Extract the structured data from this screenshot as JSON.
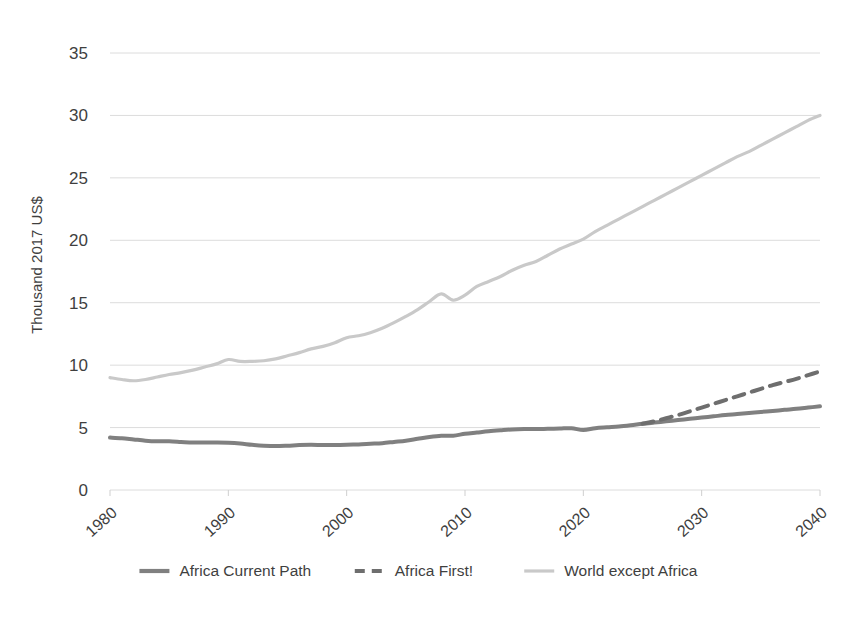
{
  "chart_data": {
    "type": "line",
    "title": "",
    "xlabel": "",
    "ylabel": "Thousand 2017 US$",
    "xlim": [
      1980,
      2040
    ],
    "ylim": [
      0,
      35
    ],
    "yticks": [
      0,
      5,
      10,
      15,
      20,
      25,
      30,
      35
    ],
    "xticks": [
      1980,
      1990,
      2000,
      2010,
      2020,
      2030,
      2040
    ],
    "grid": true,
    "legend_position": "bottom",
    "colors": {
      "africa_current_path": "#808080",
      "africa_first": "#6e6e6e",
      "world_except_africa": "#c9c9c9",
      "gridline": "#dcdcdc",
      "text": "#3f3f3f"
    },
    "series": [
      {
        "name": "Africa Current Path",
        "style": "solid",
        "color": "#808080",
        "x": [
          1980,
          1981,
          1982,
          1983,
          1984,
          1985,
          1986,
          1987,
          1988,
          1989,
          1990,
          1991,
          1992,
          1993,
          1994,
          1995,
          1996,
          1997,
          1998,
          1999,
          2000,
          2001,
          2002,
          2003,
          2004,
          2005,
          2006,
          2007,
          2008,
          2009,
          2010,
          2011,
          2012,
          2013,
          2014,
          2015,
          2016,
          2017,
          2018,
          2019,
          2020,
          2021,
          2022,
          2023,
          2024,
          2025,
          2026,
          2027,
          2028,
          2029,
          2030,
          2031,
          2032,
          2033,
          2034,
          2035,
          2036,
          2037,
          2038,
          2039,
          2040
        ],
        "y": [
          4.2,
          4.15,
          4.05,
          3.95,
          3.9,
          3.9,
          3.85,
          3.8,
          3.8,
          3.8,
          3.78,
          3.72,
          3.62,
          3.55,
          3.52,
          3.55,
          3.6,
          3.62,
          3.6,
          3.6,
          3.62,
          3.65,
          3.7,
          3.75,
          3.85,
          3.95,
          4.1,
          4.25,
          4.35,
          4.35,
          4.5,
          4.6,
          4.7,
          4.78,
          4.85,
          4.88,
          4.88,
          4.9,
          4.92,
          4.95,
          4.8,
          4.95,
          5.02,
          5.08,
          5.18,
          5.3,
          5.4,
          5.5,
          5.6,
          5.7,
          5.8,
          5.9,
          6.0,
          6.08,
          6.17,
          6.25,
          6.33,
          6.42,
          6.5,
          6.6,
          6.7
        ]
      },
      {
        "name": "Africa First!",
        "style": "dashed",
        "color": "#6e6e6e",
        "x": [
          2025,
          2026,
          2027,
          2028,
          2029,
          2030,
          2031,
          2032,
          2033,
          2034,
          2035,
          2036,
          2037,
          2038,
          2039,
          2040
        ],
        "y": [
          5.3,
          5.5,
          5.75,
          6.0,
          6.3,
          6.6,
          6.9,
          7.2,
          7.5,
          7.8,
          8.1,
          8.4,
          8.65,
          8.9,
          9.2,
          9.5
        ]
      },
      {
        "name": "World except Africa",
        "style": "solid-light",
        "color": "#c9c9c9",
        "x": [
          1980,
          1981,
          1982,
          1983,
          1984,
          1985,
          1986,
          1987,
          1988,
          1989,
          1990,
          1991,
          1992,
          1993,
          1994,
          1995,
          1996,
          1997,
          1998,
          1999,
          2000,
          2001,
          2002,
          2003,
          2004,
          2005,
          2006,
          2007,
          2008,
          2009,
          2010,
          2011,
          2012,
          2013,
          2014,
          2015,
          2016,
          2017,
          2018,
          2019,
          2020,
          2021,
          2022,
          2023,
          2024,
          2025,
          2026,
          2027,
          2028,
          2029,
          2030,
          2031,
          2032,
          2033,
          2034,
          2035,
          2036,
          2037,
          2038,
          2039,
          2040
        ],
        "y": [
          9.0,
          8.85,
          8.75,
          8.85,
          9.05,
          9.25,
          9.4,
          9.6,
          9.85,
          10.1,
          10.45,
          10.3,
          10.3,
          10.35,
          10.5,
          10.75,
          11.0,
          11.3,
          11.5,
          11.8,
          12.2,
          12.35,
          12.6,
          12.95,
          13.4,
          13.9,
          14.45,
          15.1,
          15.7,
          15.2,
          15.6,
          16.3,
          16.7,
          17.1,
          17.6,
          18.0,
          18.3,
          18.8,
          19.3,
          19.7,
          20.1,
          20.7,
          21.2,
          21.7,
          22.2,
          22.7,
          23.2,
          23.7,
          24.2,
          24.7,
          25.2,
          25.7,
          26.2,
          26.7,
          27.1,
          27.6,
          28.1,
          28.6,
          29.1,
          29.6,
          30.0
        ]
      }
    ]
  },
  "axis": {
    "y_title": "Thousand 2017 US$",
    "y_tick_labels": [
      "35",
      "30",
      "25",
      "20",
      "15",
      "10",
      "5",
      "0"
    ],
    "x_tick_labels": [
      "1980",
      "1990",
      "2000",
      "2010",
      "2020",
      "2030",
      "2040"
    ]
  },
  "legend": {
    "items": [
      {
        "label": "Africa Current Path",
        "style": "solid",
        "color": "#808080"
      },
      {
        "label": "Africa First!",
        "style": "dashed",
        "color": "#6e6e6e"
      },
      {
        "label": "World except Africa",
        "style": "solid",
        "color": "#c9c9c9"
      }
    ]
  }
}
